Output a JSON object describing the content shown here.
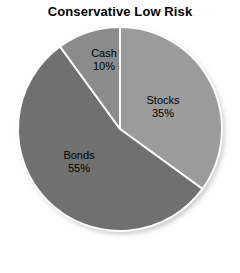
{
  "chart_data": {
    "type": "pie",
    "title": "Conservative Low Risk",
    "xlabel": "",
    "ylabel": "",
    "legend": "none",
    "grid": false,
    "start_angle_deg": 0,
    "direction": "clockwise",
    "categories": [
      "Stocks",
      "Bonds",
      "Cash"
    ],
    "values": [
      35,
      55,
      10
    ],
    "unit": "%",
    "slices": [
      {
        "name": "Stocks",
        "label": "Stocks",
        "value": 35,
        "value_label": "35%",
        "color": "#9b9b9b",
        "label_x": 163,
        "label_y": 104
      },
      {
        "name": "Bonds",
        "label": "Bonds",
        "value": 55,
        "value_label": "55%",
        "color": "#707070",
        "label_x": 79,
        "label_y": 159
      },
      {
        "name": "Cash",
        "label": "Cash",
        "value": 10,
        "value_label": "10%",
        "color": "#8b8b8b",
        "label_x": 104,
        "label_y": 57
      }
    ],
    "colors": {
      "background": "#ffffff",
      "slice_border": "#ffffff",
      "title_text": "#000000",
      "label_text": "#000000"
    },
    "geometry": {
      "center_x": 120,
      "center_y": 129,
      "radius": 102
    }
  }
}
